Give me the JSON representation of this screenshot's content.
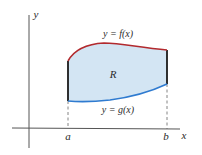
{
  "diagram": {
    "axes": {
      "x_label": "x",
      "y_label": "y"
    },
    "region_label": "R",
    "curves": {
      "top": {
        "label": "y = f(x)",
        "color": "#b22a2e"
      },
      "bottom": {
        "label": "y = g(x)",
        "color": "#2f7bd0"
      }
    },
    "bounds": {
      "left": "a",
      "right": "b"
    },
    "colors": {
      "fill": "#d3e5f3",
      "axes": "#555555",
      "side_edges": "#1a1a1a",
      "dashed": "#666666"
    }
  }
}
